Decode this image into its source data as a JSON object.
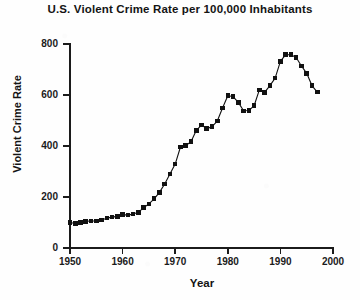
{
  "chart_data": {
    "type": "line",
    "title": "U.S. Violent Crime Rate per 100,000 Inhabitants",
    "xlabel": "Year",
    "ylabel": "Violent Crime Rate",
    "xlim": [
      1950,
      2000
    ],
    "ylim": [
      0,
      800
    ],
    "xticks": [
      1950,
      1960,
      1970,
      1980,
      1990,
      2000
    ],
    "yticks": [
      0,
      200,
      400,
      600,
      800
    ],
    "grid": false,
    "legend": null,
    "marker": "filled-square",
    "series_color": "#111111",
    "x": [
      1950,
      1951,
      1952,
      1953,
      1954,
      1955,
      1956,
      1957,
      1958,
      1959,
      1960,
      1961,
      1962,
      1963,
      1964,
      1965,
      1966,
      1967,
      1968,
      1969,
      1970,
      1971,
      1972,
      1973,
      1974,
      1975,
      1976,
      1977,
      1978,
      1979,
      1980,
      1981,
      1982,
      1983,
      1984,
      1985,
      1986,
      1987,
      1988,
      1989,
      1990,
      1991,
      1992,
      1993,
      1994,
      1995,
      1996,
      1997
    ],
    "values": [
      100,
      96,
      100,
      105,
      106,
      106,
      110,
      117,
      121,
      124,
      131,
      129,
      133,
      140,
      158,
      173,
      193,
      218,
      251,
      290,
      329,
      396,
      401,
      417,
      461,
      482,
      468,
      476,
      498,
      549,
      597,
      594,
      571,
      538,
      539,
      558,
      620,
      610,
      637,
      666,
      732,
      758,
      758,
      747,
      714,
      685,
      637,
      611
    ],
    "annotations": [
      {
        "label": "post-1991 decline",
        "x_start": 1992,
        "x_end": 1997
      }
    ]
  },
  "axis": {
    "y_tick_labels": [
      "800",
      "600",
      "400",
      "200",
      "0"
    ],
    "x_tick_labels": [
      "1950",
      "1960",
      "1970",
      "1980",
      "1990",
      "2000"
    ]
  }
}
